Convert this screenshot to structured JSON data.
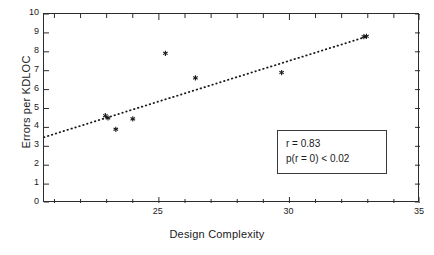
{
  "chart_data": {
    "type": "scatter",
    "title": "",
    "xlabel": "Design Complexity",
    "ylabel": "Errors per KDLOC",
    "xlim": [
      20.6,
      35
    ],
    "ylim": [
      0,
      10
    ],
    "grid": false,
    "legend": null,
    "xticks": [
      25,
      30,
      35
    ],
    "xtick_labels": [
      "25",
      "30",
      "35"
    ],
    "x_minor_tick_step": 1,
    "yticks": [
      0,
      1,
      2,
      3,
      4,
      5,
      6,
      7,
      8,
      9,
      10
    ],
    "ytick_labels": [
      "0",
      "1",
      "2",
      "3",
      "4",
      "5",
      "6",
      "7",
      "8",
      "9",
      "10"
    ],
    "series": [
      {
        "name": "observations",
        "type": "scatter",
        "marker": "asterisk",
        "color": "#1a1a1a",
        "points": [
          {
            "x": 22.95,
            "y": 4.62
          },
          {
            "x": 23.05,
            "y": 4.5
          },
          {
            "x": 23.35,
            "y": 3.9
          },
          {
            "x": 24.0,
            "y": 4.45
          },
          {
            "x": 25.25,
            "y": 7.92
          },
          {
            "x": 26.4,
            "y": 6.62
          },
          {
            "x": 29.7,
            "y": 6.9
          },
          {
            "x": 32.85,
            "y": 8.8
          },
          {
            "x": 32.95,
            "y": 8.82
          }
        ]
      },
      {
        "name": "regression-line",
        "type": "line",
        "style": "dotted",
        "color": "#1a1a1a",
        "x": [
          20.6,
          33.0
        ],
        "y": [
          3.48,
          8.82
        ]
      }
    ],
    "annotations": [
      {
        "name": "stats-box",
        "lines": [
          "r = 0.83",
          "p(r = 0) < 0.02"
        ],
        "x": 29.5,
        "y": 3.1
      }
    ]
  },
  "stats": {
    "r_label": "r = 0.83",
    "p_label": "p(r = 0) < 0.02"
  }
}
